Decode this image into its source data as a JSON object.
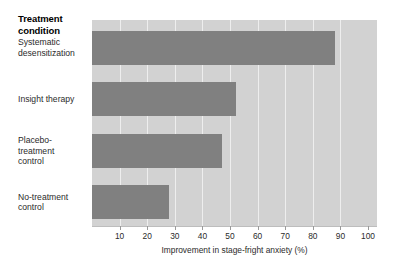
{
  "chart_data": {
    "type": "bar",
    "orientation": "horizontal",
    "title": "Treatment\ncondition",
    "title_lines": [
      "Treatment",
      "condition"
    ],
    "categories": [
      "Systematic desensitization",
      "Insight therapy",
      "Placebo-treatment control",
      "No-treatment control"
    ],
    "category_lines": [
      [
        "Systematic",
        "desensitization"
      ],
      [
        "Insight therapy"
      ],
      [
        "Placebo-",
        "treatment",
        "control"
      ],
      [
        "No-treatment",
        "control"
      ]
    ],
    "values": [
      88,
      52,
      47,
      28
    ],
    "xlabel": "Improvement in stage-fright anxiety (%)",
    "ylabel": "",
    "xticks": [
      10,
      20,
      30,
      40,
      50,
      60,
      70,
      80,
      90,
      100
    ],
    "xtick_labels": [
      "10",
      "20",
      "30",
      "40",
      "50",
      "60",
      "70",
      "80",
      "90",
      "100"
    ],
    "xlim": [
      0,
      100
    ],
    "grid": true,
    "legend": "none",
    "bar_color": "#808080",
    "plot_background": "#d2d2d2",
    "gridline_color": "#eeeeee",
    "figure_background": "#ffffff"
  }
}
